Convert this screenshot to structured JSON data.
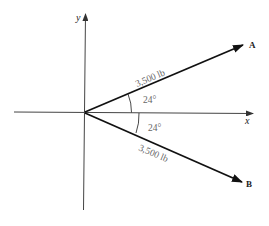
{
  "diagram": {
    "axes": {
      "x_label": "x",
      "y_label": "y"
    },
    "vectors": [
      {
        "name": "A",
        "magnitude_label": "3,500 lb",
        "angle_label": "24°"
      },
      {
        "name": "B",
        "magnitude_label": "3,500 lb",
        "angle_label": "24°"
      }
    ],
    "colors": {
      "line": "#111111",
      "axis": "#444444",
      "text": "#222222",
      "muted_text": "#666666"
    }
  }
}
